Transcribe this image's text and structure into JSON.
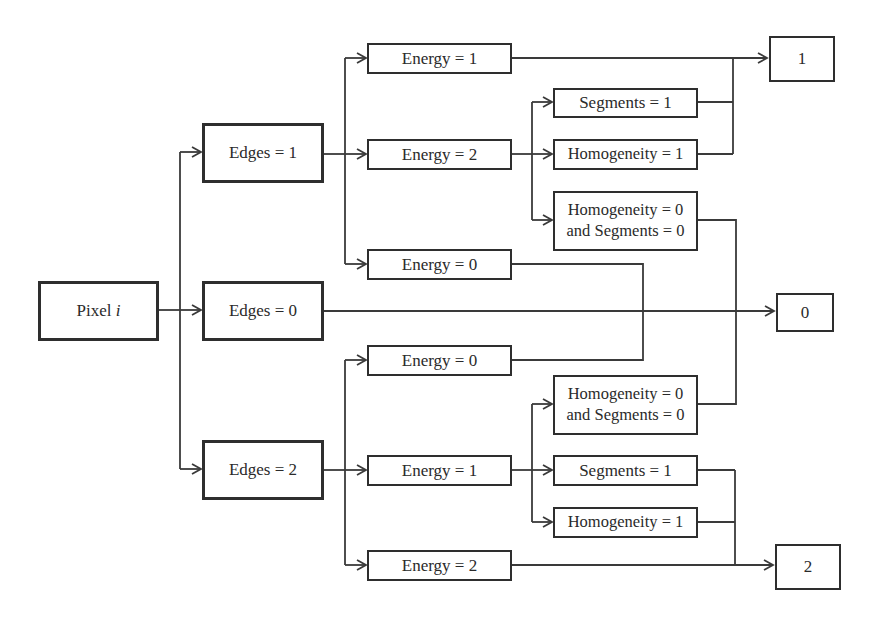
{
  "diagram": {
    "type": "decision-tree",
    "root": {
      "label": "Pixel",
      "variable": "i"
    },
    "level1": [
      {
        "id": "edges1",
        "label": "Edges = 1"
      },
      {
        "id": "edges0",
        "label": "Edges = 0"
      },
      {
        "id": "edges2",
        "label": "Edges = 2"
      }
    ],
    "level2": [
      {
        "id": "e1_energy1",
        "parent": "edges1",
        "label": "Energy = 1"
      },
      {
        "id": "e1_energy2",
        "parent": "edges1",
        "label": "Energy = 2"
      },
      {
        "id": "e1_energy0",
        "parent": "edges1",
        "label": "Energy = 0"
      },
      {
        "id": "e2_energy0",
        "parent": "edges2",
        "label": "Energy = 0"
      },
      {
        "id": "e2_energy1",
        "parent": "edges2",
        "label": "Energy = 1"
      },
      {
        "id": "e2_energy2",
        "parent": "edges2",
        "label": "Energy = 2"
      }
    ],
    "level3": [
      {
        "id": "u_seg1",
        "parent": "e1_energy2",
        "label": "Segments = 1"
      },
      {
        "id": "u_hom1",
        "parent": "e1_energy2",
        "label": "Homogeneity = 1"
      },
      {
        "id": "u_h0s0",
        "parent": "e1_energy2",
        "line1": "Homogeneity = 0",
        "line2": "and Segments = 0"
      },
      {
        "id": "l_h0s0",
        "parent": "e2_energy1",
        "line1": "Homogeneity = 0",
        "line2": "and Segments = 0"
      },
      {
        "id": "l_seg1",
        "parent": "e2_energy1",
        "label": "Segments = 1"
      },
      {
        "id": "l_hom1",
        "parent": "e2_energy1",
        "label": "Homogeneity = 1"
      }
    ],
    "outputs": [
      {
        "id": "out1",
        "label": "1",
        "inputs": [
          "e1_energy1",
          "u_seg1",
          "u_hom1"
        ]
      },
      {
        "id": "out0",
        "label": "0",
        "inputs": [
          "edges0",
          "e1_energy0",
          "e2_energy0",
          "u_h0s0",
          "l_h0s0"
        ]
      },
      {
        "id": "out2",
        "label": "2",
        "inputs": [
          "e2_energy2",
          "l_seg1",
          "l_hom1"
        ]
      }
    ],
    "colors": {
      "stroke": "#2e2e2e",
      "background": "#ffffff",
      "text": "#2a2a2a"
    }
  }
}
